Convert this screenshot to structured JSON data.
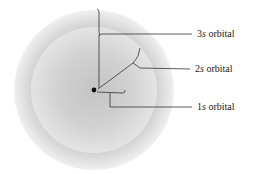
{
  "diagram": {
    "title": "",
    "nucleus": {
      "cx": 94,
      "cy": 90,
      "r": 2.4,
      "color": "#111111"
    },
    "shells": [
      {
        "name": "3s",
        "r": 80,
        "color_outer": "#ececec",
        "color_inner": "#d6d6d6"
      },
      {
        "name": "2s",
        "r": 63,
        "color_outer": "#dedede",
        "color_inner": "#cdcdcd"
      },
      {
        "name": "1s",
        "r": 31,
        "color_outer": "#cfcfcf",
        "color_inner": "#bdbdbd"
      }
    ],
    "labels": [
      {
        "id": "3s",
        "num": "3",
        "sym": "s",
        "text": " orbital",
        "x": 197,
        "y": 29
      },
      {
        "id": "2s",
        "num": "2",
        "sym": "s",
        "text": " orbital",
        "x": 195,
        "y": 65
      },
      {
        "id": "1s",
        "num": "1",
        "sym": "s",
        "text": " orbital",
        "x": 197,
        "y": 103
      }
    ],
    "line_color": "#333333"
  }
}
